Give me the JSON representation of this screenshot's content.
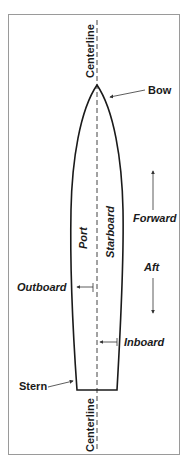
{
  "diagram": {
    "labels": {
      "centerline_top": "Centerline",
      "centerline_bottom": "Centerline",
      "bow": "Bow",
      "stern": "Stern",
      "port": "Port",
      "starboard": "Starboard",
      "forward": "Forward",
      "aft": "Aft",
      "outboard": "Outboard",
      "inboard": "Inboard"
    },
    "colors": {
      "line": "#1a1a1a",
      "frame": "#9a9a9a",
      "arrow": "#555555"
    }
  }
}
